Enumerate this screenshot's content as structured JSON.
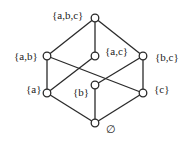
{
  "diagram": {
    "type": "hasse-diagram",
    "nodes": [
      {
        "id": "abc",
        "label": "{a,b,c}",
        "x": 95,
        "y": 18
      },
      {
        "id": "ab",
        "label": "{a,b}",
        "x": 47,
        "y": 56
      },
      {
        "id": "ac",
        "label": "{a,c}",
        "x": 95,
        "y": 56
      },
      {
        "id": "bc",
        "label": "{b,c}",
        "x": 143,
        "y": 56
      },
      {
        "id": "a",
        "label": "{a}",
        "x": 47,
        "y": 93
      },
      {
        "id": "b",
        "label": "{b}",
        "x": 95,
        "y": 85
      },
      {
        "id": "c",
        "label": "{c}",
        "x": 143,
        "y": 93
      },
      {
        "id": "empty",
        "label": "∅",
        "x": 95,
        "y": 123
      }
    ],
    "edges": [
      [
        "abc",
        "ab"
      ],
      [
        "abc",
        "ac"
      ],
      [
        "abc",
        "bc"
      ],
      [
        "ab",
        "a"
      ],
      [
        "ab",
        "b"
      ],
      [
        "ac",
        "a"
      ],
      [
        "ac",
        "c"
      ],
      [
        "bc",
        "b"
      ],
      [
        "bc",
        "c"
      ],
      [
        "a",
        "empty"
      ],
      [
        "b",
        "empty"
      ],
      [
        "c",
        "empty"
      ]
    ]
  },
  "labels": {
    "abc": "{a,b,c}",
    "ab": "{a,b}",
    "ac": "{a,c}",
    "bc": "{b,c}",
    "a": "{a}",
    "b": "{b}",
    "c": "{c}",
    "empty": "∅"
  }
}
